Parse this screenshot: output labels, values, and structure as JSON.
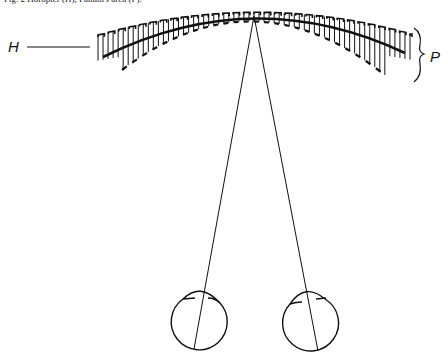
{
  "caption": "Fig. 2 Horopter (H), Panum's area (P).",
  "labels": {
    "horopter": "H",
    "panum": "P"
  },
  "colors": {
    "ink": "#111111",
    "background": "#ffffff"
  },
  "geometry": {
    "fixation_point": [
      254,
      16
    ],
    "left_eye": {
      "cx": 198,
      "cy": 322,
      "r": 28
    },
    "right_eye": {
      "cx": 312,
      "cy": 324,
      "r": 28
    }
  }
}
